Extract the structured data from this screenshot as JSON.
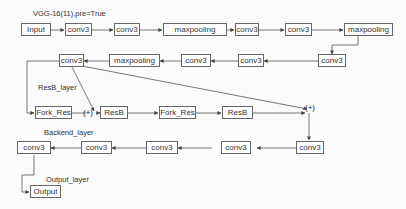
{
  "labels": {
    "vgg": "VGG-16(11),pre=True",
    "resb": "ResB_layer",
    "backend": "Backend_layer",
    "output": "Output_layer"
  },
  "nodes": {
    "input": "Input",
    "r1c1": "conv3",
    "r1c2": "conv3",
    "r1mp": "maxpooling",
    "r1c3": "conv3",
    "r1c4": "conv3",
    "r1mp2": "maxpooling",
    "r2c1": "conv3",
    "r2c2": "conv3",
    "r2c3": "conv3",
    "r2mp": "maxpooling",
    "r2c4": "conv3",
    "fork1": "Fork_Res",
    "resb1": "ResB",
    "fork2": "Fork_Res",
    "resb2": "ResB",
    "b1": "conv3",
    "b2": "conv3",
    "b3": "conv3",
    "b4": "conv3",
    "output": "Output"
  },
  "sum_nodes": {
    "plus1": "(+)",
    "plus2": "(+)"
  },
  "colors": {
    "line": "#555555",
    "border": "#666666",
    "background": "#fbfbfb"
  }
}
